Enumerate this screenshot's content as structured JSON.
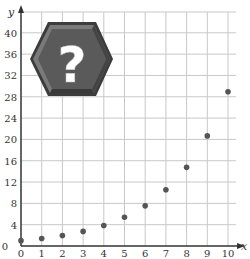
{
  "chart_data": {
    "type": "scatter",
    "title": "",
    "xlabel": "x",
    "ylabel": "y",
    "xlim": [
      0,
      10
    ],
    "ylim": [
      0,
      42
    ],
    "grid": true,
    "x_ticks": [
      0,
      1,
      2,
      3,
      4,
      5,
      6,
      7,
      8,
      9,
      10
    ],
    "y_ticks": [
      0,
      4,
      8,
      12,
      16,
      20,
      24,
      28,
      32,
      36,
      40
    ],
    "series": [
      {
        "name": "points",
        "x": [
          0,
          1,
          2,
          3,
          4,
          5,
          6,
          7,
          8,
          9,
          10
        ],
        "y": [
          1,
          1.4,
          1.96,
          2.74,
          3.84,
          5.38,
          7.53,
          10.54,
          14.76,
          20.66,
          28.93
        ],
        "color": "#555555"
      }
    ],
    "annotations": [
      {
        "type": "icon",
        "name": "question-mark-hexagon",
        "text": "?"
      }
    ]
  },
  "colors": {
    "grid": "#c8c8c8",
    "axis": "#333333",
    "point": "#555555",
    "hexagon": "#5a5a5a",
    "hexagon_dark": "#3c3c3c",
    "hexagon_light": "#7a7a7a"
  }
}
